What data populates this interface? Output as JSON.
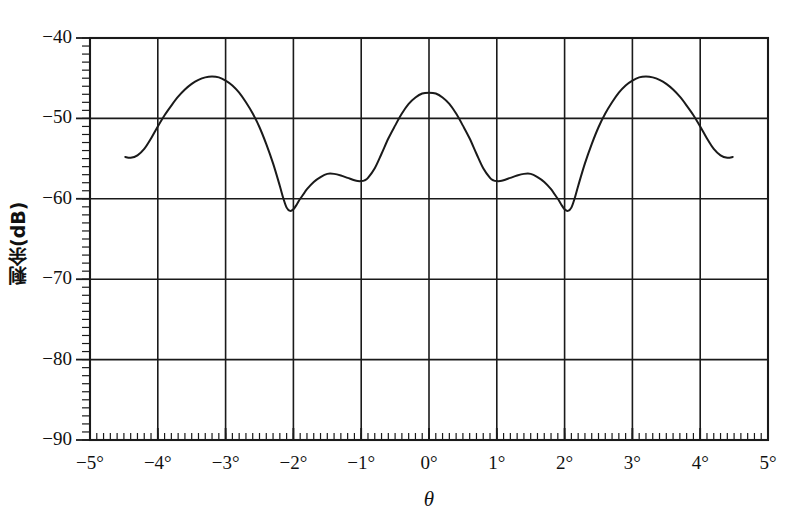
{
  "chart_data": {
    "type": "line",
    "title": "",
    "subtitle": "",
    "xlabel": "θ",
    "ylabel": "剩余(dB)",
    "xlim": [
      -5,
      5
    ],
    "ylim": [
      -90,
      -40
    ],
    "xtick_labels": [
      "−5°",
      "−4°",
      "−3°",
      "−2°",
      "−1°",
      "0°",
      "1°",
      "2°",
      "3°",
      "4°",
      "5°"
    ],
    "xticks": [
      -5,
      -4,
      -3,
      -2,
      -1,
      0,
      1,
      2,
      3,
      4,
      5
    ],
    "ytick_labels": [
      "−40",
      "−50",
      "−60",
      "−70",
      "−80",
      "−90"
    ],
    "yticks": [
      -40,
      -50,
      -60,
      -70,
      -80,
      -90
    ],
    "x_minor_tick_step": 0.1,
    "y_minor_tick_step": 1,
    "grid": true,
    "grid_color": "#1a1a1a",
    "line_color": "#1a1a1a",
    "legend": "none",
    "series": [
      {
        "name": "剩余(dB)",
        "x": [
          -4.48,
          -4.4,
          -4.3,
          -4.2,
          -4.1,
          -4.0,
          -3.9,
          -3.8,
          -3.7,
          -3.6,
          -3.5,
          -3.4,
          -3.3,
          -3.2,
          -3.1,
          -3.0,
          -2.9,
          -2.8,
          -2.7,
          -2.6,
          -2.5,
          -2.4,
          -2.3,
          -2.2,
          -2.15,
          -2.1,
          -2.05,
          -2.0,
          -1.95,
          -1.9,
          -1.85,
          -1.8,
          -1.7,
          -1.6,
          -1.5,
          -1.4,
          -1.3,
          -1.2,
          -1.1,
          -1.05,
          -1.0,
          -0.95,
          -0.9,
          -0.8,
          -0.7,
          -0.6,
          -0.5,
          -0.4,
          -0.3,
          -0.2,
          -0.1,
          0.0,
          0.1,
          0.2,
          0.3,
          0.4,
          0.5,
          0.6,
          0.7,
          0.8,
          0.9,
          0.95,
          1.0,
          1.05,
          1.1,
          1.2,
          1.3,
          1.4,
          1.5,
          1.6,
          1.7,
          1.8,
          1.85,
          1.9,
          1.95,
          2.0,
          2.05,
          2.1,
          2.15,
          2.2,
          2.3,
          2.4,
          2.5,
          2.6,
          2.7,
          2.8,
          2.9,
          3.0,
          3.1,
          3.2,
          3.3,
          3.4,
          3.5,
          3.6,
          3.7,
          3.8,
          3.9,
          4.0,
          4.1,
          4.2,
          4.3,
          4.4,
          4.48
        ],
        "y": [
          -54.8,
          -54.9,
          -54.6,
          -53.8,
          -52.5,
          -51.0,
          -49.6,
          -48.4,
          -47.3,
          -46.4,
          -45.7,
          -45.2,
          -44.9,
          -44.8,
          -44.9,
          -45.3,
          -45.9,
          -46.8,
          -48.0,
          -49.4,
          -51.1,
          -53.2,
          -55.6,
          -58.4,
          -59.9,
          -61.1,
          -61.5,
          -61.3,
          -60.7,
          -60.0,
          -59.4,
          -58.8,
          -57.9,
          -57.3,
          -56.9,
          -56.9,
          -57.1,
          -57.4,
          -57.7,
          -57.8,
          -57.8,
          -57.7,
          -57.4,
          -56.2,
          -54.4,
          -52.5,
          -50.9,
          -49.4,
          -48.2,
          -47.4,
          -46.9,
          -46.8,
          -46.9,
          -47.4,
          -48.2,
          -49.4,
          -50.9,
          -52.5,
          -54.4,
          -56.2,
          -57.4,
          -57.7,
          -57.8,
          -57.8,
          -57.7,
          -57.4,
          -57.1,
          -56.9,
          -56.9,
          -57.3,
          -57.9,
          -58.8,
          -59.4,
          -60.0,
          -60.7,
          -61.3,
          -61.5,
          -61.1,
          -59.9,
          -58.4,
          -55.6,
          -53.2,
          -51.1,
          -49.4,
          -48.0,
          -46.8,
          -45.9,
          -45.3,
          -44.9,
          -44.8,
          -44.9,
          -45.2,
          -45.7,
          -46.4,
          -47.3,
          -48.4,
          -49.6,
          -51.0,
          -52.5,
          -53.8,
          -54.6,
          -54.9,
          -54.8
        ]
      }
    ]
  },
  "axes": {
    "y_label": "剩余(dB)",
    "x_label": "θ"
  }
}
